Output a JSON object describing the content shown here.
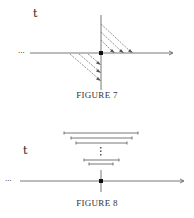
{
  "figures": [
    {
      "id": "figure-7",
      "caption": "FIGURE 7",
      "axis_label": "t",
      "left_ellipsis": "···",
      "description": "Horizontal time axis with vertical line at origin; two hatched right triangles with dashed diagonal arrows (upper-right and lower-left)"
    },
    {
      "id": "figure-8",
      "caption": "FIGURE 8",
      "axis_label": "t",
      "left_ellipsis": "···",
      "vertical_ellipsis": "⋮",
      "description": "Nested shrinking intervals centered above the origin point on a time axis",
      "intervals_count_visible": 5
    }
  ],
  "colors": {
    "line": "#555555",
    "dash": "#666666",
    "point": "#111111"
  }
}
